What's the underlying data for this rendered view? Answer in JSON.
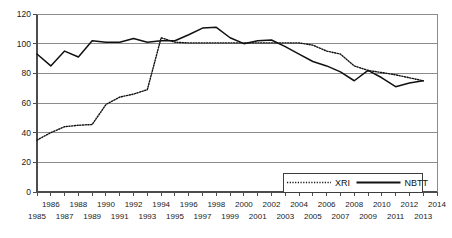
{
  "chart_data": {
    "type": "line",
    "title": "",
    "subtitle": "",
    "xlabel": "",
    "ylabel": "",
    "ylim": [
      0,
      120
    ],
    "xlim": [
      1985,
      2014
    ],
    "yticks": [
      0,
      20,
      40,
      60,
      80,
      100,
      120
    ],
    "ytick_labels": [
      "0",
      "20",
      "40",
      "60",
      "80",
      "100",
      "120"
    ],
    "grid": true,
    "grid_axis": "y",
    "legend_position": "bottom-right",
    "x": [
      1985,
      1986,
      1987,
      1988,
      1989,
      1990,
      1991,
      1992,
      1993,
      1994,
      1995,
      1996,
      1997,
      1998,
      1999,
      2000,
      2001,
      2002,
      2003,
      2004,
      2005,
      2006,
      2007,
      2008,
      2009,
      2010,
      2011,
      2012,
      2013
    ],
    "xtick_labels_row1": [
      "",
      "1986",
      "",
      "1988",
      "",
      "1990",
      "",
      "1992",
      "",
      "1994",
      "",
      "1996",
      "",
      "1998",
      "",
      "2000",
      "",
      "2002",
      "",
      "2004",
      "",
      "2006",
      "",
      "2008",
      "",
      "2010",
      "",
      "2012",
      "",
      "2014"
    ],
    "xtick_labels_row2": [
      "1985",
      "",
      "1987",
      "",
      "1989",
      "",
      "1991",
      "",
      "1993",
      "",
      "1995",
      "",
      "1997",
      "",
      "1999",
      "",
      "2001",
      "",
      "2003",
      "",
      "2005",
      "",
      "2007",
      "",
      "2009",
      "",
      "2011",
      "",
      "2013",
      ""
    ],
    "xticks_all": [
      1985,
      1986,
      1987,
      1988,
      1989,
      1990,
      1991,
      1992,
      1993,
      1994,
      1995,
      1996,
      1997,
      1998,
      1999,
      2000,
      2001,
      2002,
      2003,
      2004,
      2005,
      2006,
      2007,
      2008,
      2009,
      2010,
      2011,
      2012,
      2013,
      2014
    ],
    "series": [
      {
        "name": "XRI",
        "style": "dotted",
        "color": "#111111",
        "values": [
          35,
          40,
          44,
          45,
          45.5,
          59,
          64,
          66,
          69,
          104,
          101,
          100.5,
          100.5,
          100.5,
          100.5,
          100.5,
          100.5,
          100.5,
          100.5,
          100.5,
          99,
          95,
          93,
          85,
          82,
          80.5,
          79,
          77,
          75
        ]
      },
      {
        "name": "NBTT",
        "style": "solid",
        "color": "#111111",
        "values": [
          93,
          85,
          95,
          91,
          102,
          101,
          101,
          103.5,
          101,
          102,
          102,
          106,
          110.5,
          111,
          104,
          100,
          102,
          102.5,
          98,
          93,
          88,
          85,
          81,
          75,
          82,
          77,
          71,
          73.5,
          75
        ]
      }
    ]
  },
  "legend": {
    "entries": [
      {
        "label": "XRI",
        "style": "dotted"
      },
      {
        "label": "NBTT",
        "style": "solid"
      }
    ]
  }
}
